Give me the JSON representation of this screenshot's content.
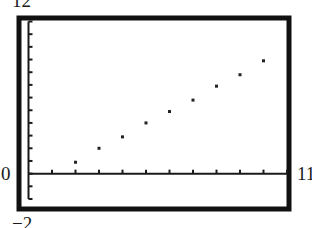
{
  "window": {
    "xmin_label": "0",
    "xmax_label": "11",
    "ymin_label": "−2",
    "ymax_label": "12"
  },
  "colors": {
    "frame": "#111111",
    "axis": "#1a1a1a",
    "point": "#222222",
    "background": "#ffffff"
  },
  "chart_data": {
    "type": "scatter",
    "title": "",
    "xlabel": "",
    "ylabel": "",
    "xlim": [
      0,
      11
    ],
    "ylim": [
      -2,
      12
    ],
    "xscl": 1,
    "yscl": 1,
    "grid": false,
    "legend": null,
    "tick_labels": {
      "xmin": "0",
      "xmax": "11",
      "ymin": "−2",
      "ymax": "12"
    },
    "x": [
      2,
      3,
      4,
      5,
      6,
      7,
      8,
      9,
      10
    ],
    "y": [
      0.9,
      2.0,
      2.9,
      4.0,
      4.9,
      5.8,
      6.9,
      7.8,
      8.9
    ]
  }
}
